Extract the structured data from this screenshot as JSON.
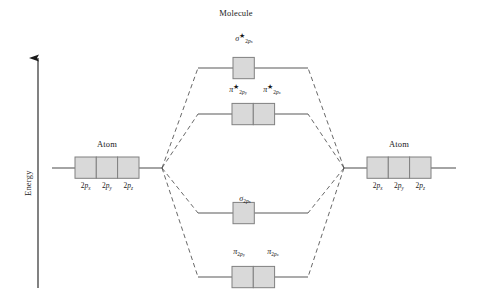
{
  "figure": {
    "type": "molecular-orbital-energy-diagram",
    "background_color": "#ffffff",
    "box_fill_color": "#d9d9d9",
    "box_stroke_color": "#808080",
    "line_color": "#595959",
    "text_color": "#1a1a1a"
  },
  "axis": {
    "label": "Energy",
    "direction": "up",
    "arrow": "up-arrow-icon"
  },
  "headings": {
    "center": "Molecule",
    "left_atom": "Atom",
    "right_atom": "Atom"
  },
  "atomic_orbitals": {
    "left": {
      "heading": "Atom",
      "boxes": [
        {
          "prefix": "2p",
          "sub": "x",
          "label": "2px"
        },
        {
          "prefix": "2p",
          "sub": "y",
          "label": "2py"
        },
        {
          "prefix": "2p",
          "sub": "z",
          "label": "2pz"
        }
      ]
    },
    "right": {
      "heading": "Atom",
      "boxes": [
        {
          "prefix": "2p",
          "sub": "x",
          "label": "2px"
        },
        {
          "prefix": "2p",
          "sub": "y",
          "label": "2py"
        },
        {
          "prefix": "2p",
          "sub": "z",
          "label": "2pz"
        }
      ]
    }
  },
  "molecular_orbitals": [
    {
      "id": "sigma-star-2px",
      "kind": "antibonding",
      "symbol": "σ",
      "starred": true,
      "sub_main": "2p",
      "sub_sub": "x",
      "label": "σ*2px",
      "box_count": 1,
      "level": "highest"
    },
    {
      "id": "pi-star-2py-2pz",
      "kind": "antibonding",
      "symbol": "π",
      "starred": true,
      "labels": [
        {
          "symbol": "π",
          "starred": true,
          "sub_main": "2p",
          "sub_sub": "y",
          "label": "π*2py"
        },
        {
          "symbol": "π",
          "starred": true,
          "sub_main": "2p",
          "sub_sub": "z",
          "label": "π*2pz"
        }
      ],
      "box_count": 2,
      "level": "second"
    },
    {
      "id": "sigma-2px",
      "kind": "bonding",
      "symbol": "σ",
      "starred": false,
      "sub_main": "2p",
      "sub_sub": "x",
      "label": "σ2px",
      "box_count": 1,
      "level": "third"
    },
    {
      "id": "pi-2py-2pz",
      "kind": "bonding",
      "symbol": "π",
      "starred": false,
      "labels": [
        {
          "symbol": "π",
          "starred": false,
          "sub_main": "2p",
          "sub_sub": "y",
          "label": "π2py"
        },
        {
          "symbol": "π",
          "starred": false,
          "sub_main": "2p",
          "sub_sub": "z",
          "label": "π2pz"
        }
      ],
      "box_count": 2,
      "level": "lowest"
    }
  ]
}
